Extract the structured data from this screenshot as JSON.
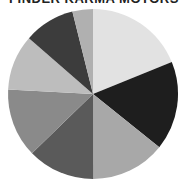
{
  "chart_data": {
    "type": "pie",
    "title": "FINDER KARMA MOTORS",
    "legend": "none",
    "start_angle_deg": 0,
    "direction": "clockwise",
    "slices": [
      {
        "label": "",
        "value": 18.9,
        "color": "#e2e2e2"
      },
      {
        "label": "",
        "value": 16.9,
        "color": "#1e1e1e"
      },
      {
        "label": "",
        "value": 14.2,
        "color": "#a8a8a8"
      },
      {
        "label": "",
        "value": 12.8,
        "color": "#5a5a5a"
      },
      {
        "label": "",
        "value": 13.1,
        "color": "#8a8a8a"
      },
      {
        "label": "",
        "value": 10.6,
        "color": "#bdbdbd"
      },
      {
        "label": "",
        "value": 9.7,
        "color": "#3c3c3c"
      },
      {
        "label": "",
        "value": 3.9,
        "color": "#b0b0b0"
      }
    ]
  },
  "layout": {
    "cx": 93,
    "cy": 94,
    "r": 85
  }
}
